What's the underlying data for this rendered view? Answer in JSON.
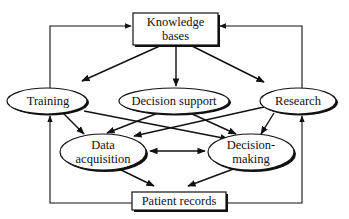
{
  "diagram": {
    "type": "flow",
    "nodes": {
      "knowledge_bases": {
        "line1": "Knowledge",
        "line2": "bases",
        "shape": "box"
      },
      "training": {
        "label": "Training",
        "shape": "ellipse"
      },
      "decision_support": {
        "label": "Decision support",
        "shape": "ellipse"
      },
      "research": {
        "label": "Research",
        "shape": "ellipse"
      },
      "data_acquisition": {
        "line1": "Data",
        "line2": "acquisition",
        "shape": "ellipse"
      },
      "decision_making": {
        "line1": "Decision-",
        "line2": "making",
        "shape": "ellipse"
      },
      "patient_records": {
        "label": "Patient records",
        "shape": "box"
      }
    },
    "edges": [
      {
        "from": "Knowledge bases",
        "to": "Training"
      },
      {
        "from": "Knowledge bases",
        "to": "Decision support"
      },
      {
        "from": "Knowledge bases",
        "to": "Research"
      },
      {
        "from": "Training",
        "to": "Data acquisition"
      },
      {
        "from": "Training",
        "to": "Decision-making"
      },
      {
        "from": "Decision support",
        "to": "Data acquisition"
      },
      {
        "from": "Decision support",
        "to": "Decision-making"
      },
      {
        "from": "Research",
        "to": "Data acquisition"
      },
      {
        "from": "Research",
        "to": "Decision-making"
      },
      {
        "from": "Data acquisition",
        "to": "Decision-making",
        "bidirectional": true
      },
      {
        "from": "Data acquisition",
        "to": "Patient records"
      },
      {
        "from": "Decision-making",
        "to": "Patient records"
      },
      {
        "from": "Patient records",
        "to": "Training",
        "route": "left loop"
      },
      {
        "from": "Patient records",
        "to": "Research",
        "route": "right loop"
      },
      {
        "from": "Training",
        "to": "Knowledge bases",
        "route": "top-left loop"
      },
      {
        "from": "Research",
        "to": "Knowledge bases",
        "route": "top-right loop"
      }
    ]
  }
}
